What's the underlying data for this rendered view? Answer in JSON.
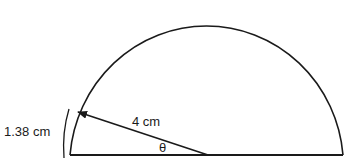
{
  "diagram": {
    "shape": "semicircle",
    "labels": {
      "arc_length": "1.38 cm",
      "radius": "4 cm",
      "angle": "θ"
    },
    "colors": {
      "stroke": "#1a1a1a",
      "background": "#ffffff"
    }
  }
}
